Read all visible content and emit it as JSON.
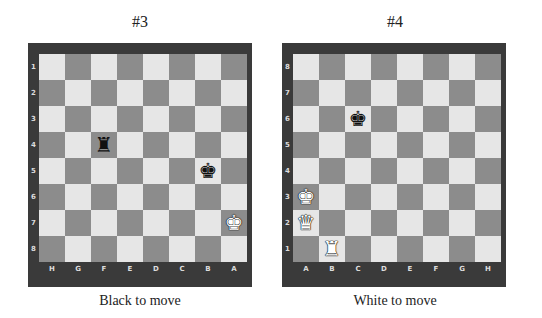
{
  "colors": {
    "light_square": "#e6e6e6",
    "dark_square": "#8c8c8c",
    "frame": "#3a3a3a"
  },
  "puzzles": [
    {
      "title": "#3",
      "caption": "Black to move",
      "orientation": "black",
      "rank_labels": [
        "1",
        "2",
        "3",
        "4",
        "5",
        "6",
        "7",
        "8"
      ],
      "file_labels": [
        "H",
        "G",
        "F",
        "E",
        "D",
        "C",
        "B",
        "A"
      ],
      "pieces": [
        {
          "square": "f4",
          "piece": "rook",
          "color": "black",
          "glyph": "♜"
        },
        {
          "square": "b5",
          "piece": "king",
          "color": "black",
          "glyph": "♚"
        },
        {
          "square": "a7",
          "piece": "king",
          "color": "white",
          "glyph": "♚"
        }
      ]
    },
    {
      "title": "#4",
      "caption": "White to move",
      "orientation": "white",
      "rank_labels": [
        "8",
        "7",
        "6",
        "5",
        "4",
        "3",
        "2",
        "1"
      ],
      "file_labels": [
        "A",
        "B",
        "C",
        "D",
        "E",
        "F",
        "G",
        "H"
      ],
      "pieces": [
        {
          "square": "c6",
          "piece": "king",
          "color": "black",
          "glyph": "♚"
        },
        {
          "square": "a3",
          "piece": "king",
          "color": "white",
          "glyph": "♚"
        },
        {
          "square": "a2",
          "piece": "queen",
          "color": "white",
          "glyph": "♛"
        },
        {
          "square": "b1",
          "piece": "rook",
          "color": "white",
          "glyph": "♜"
        }
      ]
    }
  ]
}
